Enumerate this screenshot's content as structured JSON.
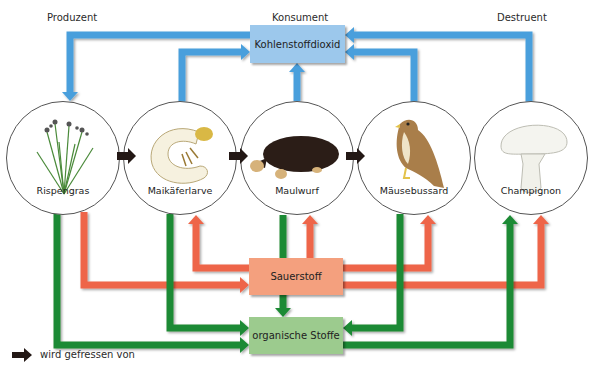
{
  "headers": {
    "producer": "Produzent",
    "consumer": "Konsument",
    "decomposer": "Destruent"
  },
  "boxes": {
    "co2": {
      "label": "Kohlenstoffdioxid",
      "color": "#9cc8ec"
    },
    "oxygen": {
      "label": "Sauerstoff",
      "color": "#f4a07e"
    },
    "organic": {
      "label": "organische Stoffe",
      "color": "#9ccb8e"
    }
  },
  "organisms": [
    {
      "id": "rispengras",
      "label": "Rispengras",
      "role": "Produzent"
    },
    {
      "id": "maikaeferlarve",
      "label": "Maikäferlarve",
      "role": "Konsument"
    },
    {
      "id": "maulwurf",
      "label": "Maulwurf",
      "role": "Konsument"
    },
    {
      "id": "maeusebussard",
      "label": "Mäusebussard",
      "role": "Konsument"
    },
    {
      "id": "champignon",
      "label": "Champignon",
      "role": "Destruent"
    }
  ],
  "arrow_colors": {
    "co2": "#4a9fdc",
    "oxygen": "#ee6548",
    "organic": "#1e8a34",
    "food": "#231815"
  },
  "flows": {
    "food_chain": [
      [
        "Rispengras",
        "Maikäferlarve"
      ],
      [
        "Maikäferlarve",
        "Maulwurf"
      ],
      [
        "Maulwurf",
        "Mäusebussard"
      ]
    ],
    "co2_from": [
      "Maikäferlarve",
      "Maulwurf",
      "Mäusebussard",
      "Champignon"
    ],
    "co2_to": [
      "Rispengras"
    ],
    "oxygen_from": [
      "Rispengras"
    ],
    "oxygen_to": [
      "Maikäferlarve",
      "Maulwurf",
      "Mäusebussard",
      "Champignon"
    ],
    "organic_from": [
      "Rispengras",
      "Maikäferlarve",
      "Maulwurf",
      "Mäusebussard"
    ],
    "organic_to": [
      "Champignon"
    ]
  },
  "legend": {
    "food_arrow": "wird gefressen von"
  }
}
